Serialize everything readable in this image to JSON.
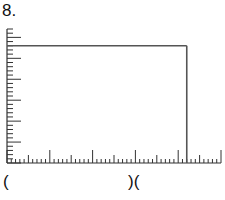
{
  "problem": {
    "number_label": "8."
  },
  "graph": {
    "line_color": "#555555",
    "axis_color": "#333333",
    "x_axis": {
      "minor_ticks": 50,
      "major_every": 10,
      "mid_every": 5
    },
    "y_axis": {
      "minor_ticks": 32,
      "major_every": 5
    },
    "rectangle": {
      "top_tick": 28,
      "right_tick": 42
    }
  },
  "answer_line": {
    "left_bracket": "(",
    "right_brackets": ")("
  }
}
